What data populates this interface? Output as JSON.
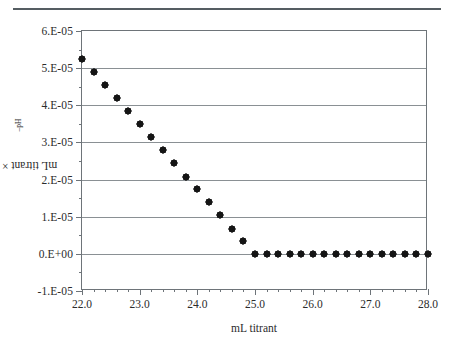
{
  "figure": {
    "header_rule": "horizontal-rule",
    "xaxis_title": "mL titrant",
    "yaxis_title_main": "mL titrant × 10",
    "yaxis_title_exponent": "–pH"
  },
  "chart_data": {
    "type": "scatter",
    "title": "",
    "xlabel": "mL titrant",
    "ylabel": "mL titrant × 10^-pH",
    "xlim": [
      22.0,
      28.0
    ],
    "ylim": [
      -1e-05,
      6e-05
    ],
    "xticks": [
      22.0,
      23.0,
      24.0,
      25.0,
      26.0,
      27.0,
      28.0
    ],
    "xtick_labels": [
      "22.0",
      "23.0",
      "24.0",
      "25.0",
      "26.0",
      "27.0",
      "28.0"
    ],
    "xtick_minor_step": 0.2,
    "yticks": [
      -1e-05,
      0,
      1e-05,
      2e-05,
      3e-05,
      4e-05,
      5e-05,
      6e-05
    ],
    "ytick_labels": [
      "-1.E-05",
      "0.E+00",
      "1.E-05",
      "2.E-05",
      "3.E-05",
      "4.E-05",
      "5.E-05",
      "6.E-05"
    ],
    "ytick_minor_step": 5e-06,
    "grid": "horizontal-major",
    "legend": "none",
    "marker": "diamond",
    "marker_color": "#151515",
    "series": [
      {
        "name": "mL titrant × 10^-pH",
        "x": [
          22.0,
          22.2,
          22.4,
          22.6,
          22.8,
          23.0,
          23.2,
          23.4,
          23.6,
          23.8,
          24.0,
          24.2,
          24.4,
          24.6,
          24.8,
          25.0,
          25.2,
          25.4,
          25.6,
          25.8,
          26.0,
          26.2,
          26.4,
          26.6,
          26.8,
          27.0,
          27.2,
          27.4,
          27.6,
          27.8,
          28.0
        ],
        "y": [
          5.25e-05,
          4.9e-05,
          4.55e-05,
          4.2e-05,
          3.85e-05,
          3.49e-05,
          3.14e-05,
          2.79e-05,
          2.44e-05,
          2.08e-05,
          1.74e-05,
          1.39e-05,
          1.04e-05,
          6.8e-06,
          3.4e-06,
          0.0,
          0.0,
          0.0,
          0.0,
          0.0,
          0.0,
          0.0,
          0.0,
          0.0,
          0.0,
          0.0,
          0.0,
          0.0,
          0.0,
          0.0,
          0.0
        ]
      }
    ]
  }
}
